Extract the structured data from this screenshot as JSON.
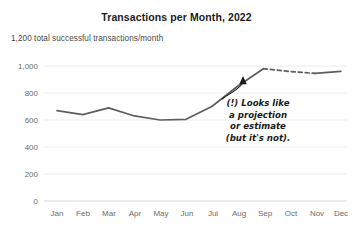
{
  "chart_data": {
    "type": "line",
    "title": "Transactions per Month, 2022",
    "subtitle": "1,200 total successful transactions/month",
    "xlabel": "",
    "ylabel": "",
    "categories": [
      "Jan",
      "Feb",
      "Mar",
      "Apr",
      "May",
      "Jun",
      "Jul",
      "Aug",
      "Sep",
      "Oct",
      "Nov",
      "Dec"
    ],
    "values": [
      670,
      640,
      690,
      630,
      600,
      605,
      700,
      850,
      980,
      960,
      945,
      960
    ],
    "series": [
      {
        "name": "Successful transactions",
        "values": [
          670,
          640,
          690,
          630,
          600,
          605,
          700,
          850,
          980,
          960,
          945,
          960
        ]
      }
    ],
    "ylim": [
      0,
      1000
    ],
    "yticks": [
      0,
      200,
      400,
      600,
      800,
      1000
    ],
    "ytick_labels": [
      "0",
      "200",
      "400",
      "600",
      "800",
      "1,000"
    ],
    "grid": true,
    "legend": "none",
    "line_color": "#5e5e5e",
    "grid_color": "#ececec",
    "dashed_segment": {
      "from": "Sep",
      "to": "Nov",
      "style": "dashed"
    },
    "annotations": [
      {
        "name": "projection-callout",
        "lines": [
          "(!) Looks like",
          "a projection",
          "or estimate",
          "(but it's not)."
        ],
        "points_to": "dashed segment between Sep and Oct"
      }
    ]
  },
  "annotation": {
    "line1": "(!) Looks like",
    "line2": "a projection",
    "line3": "or estimate",
    "line4": "(but it's not)."
  },
  "axis": {
    "y_labels": [
      "1,000",
      "800",
      "600",
      "400",
      "200",
      "0"
    ],
    "x_labels": [
      "Jan",
      "Feb",
      "Mar",
      "Apr",
      "May",
      "Jun",
      "Jul",
      "Aug",
      "Sep",
      "Oct",
      "Nov",
      "Dec"
    ]
  }
}
